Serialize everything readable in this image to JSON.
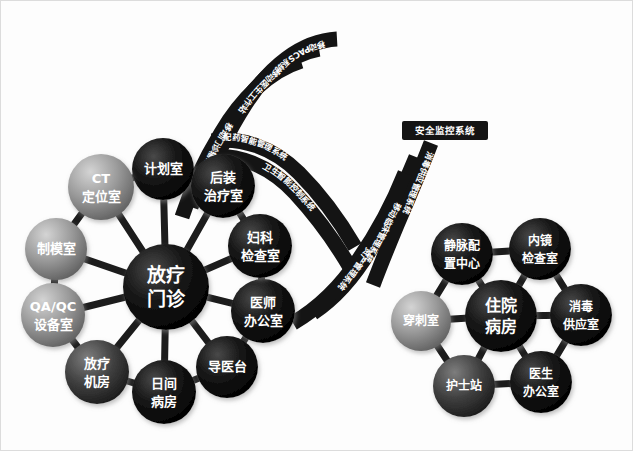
{
  "diagram": {
    "background_color": "#fdfdfd",
    "edge_color": "#1c1c1c",
    "band_color": "#141414",
    "text_color": "#ffffff"
  },
  "clusters": [
    {
      "id": "radiotherapy-outpatient",
      "center": {
        "label_line1": "放疗",
        "label_line2": "门诊",
        "cx": 165,
        "cy": 286,
        "r": 43,
        "color": "#0d0d0d",
        "font_size": 19
      },
      "nodes": [
        {
          "id": "plan-room",
          "label_line1": "计划室",
          "label_line2": "",
          "cx": 162,
          "cy": 168,
          "r": 31,
          "color": "#111111",
          "font_size": 13
        },
        {
          "id": "ct-locate",
          "label_line1": "CT",
          "label_line2": "定位室",
          "cx": 100,
          "cy": 186,
          "r": 33,
          "color": "#8c8c8c",
          "font_size": 13
        },
        {
          "id": "mold-room",
          "label_line1": "制模室",
          "label_line2": "",
          "cx": 55,
          "cy": 248,
          "r": 31,
          "color": "#777777",
          "font_size": 13
        },
        {
          "id": "qaqc-equipment",
          "label_line1": "QA/QC",
          "label_line2": "设备室",
          "cx": 52,
          "cy": 314,
          "r": 32,
          "color": "#8a8a8a",
          "font_size": 13
        },
        {
          "id": "rt-machine",
          "label_line1": "放疗",
          "label_line2": "机房",
          "cx": 96,
          "cy": 371,
          "r": 32,
          "color": "#4a4a4a",
          "font_size": 13
        },
        {
          "id": "day-ward",
          "label_line1": "日间",
          "label_line2": "病房",
          "cx": 163,
          "cy": 391,
          "r": 32,
          "color": "#2a2a2a",
          "font_size": 13
        },
        {
          "id": "guide-desk",
          "label_line1": "导医台",
          "label_line2": "",
          "cx": 226,
          "cy": 366,
          "r": 31,
          "color": "#161616",
          "font_size": 13
        },
        {
          "id": "doctor-office",
          "label_line1": "医师",
          "label_line2": "办公室",
          "cx": 262,
          "cy": 310,
          "r": 32,
          "color": "#101010",
          "font_size": 13
        },
        {
          "id": "gyn-exam",
          "label_line1": "妇科",
          "label_line2": "检查室",
          "cx": 259,
          "cy": 245,
          "r": 32,
          "color": "#0e0e0e",
          "font_size": 13
        },
        {
          "id": "brachytherapy",
          "label_line1": "后装",
          "label_line2": "治疗室",
          "cx": 222,
          "cy": 185,
          "r": 32,
          "color": "#0e0e0e",
          "font_size": 13
        }
      ]
    },
    {
      "id": "inpatient-ward",
      "center": {
        "label_line1": "住院",
        "label_line2": "病房",
        "cx": 500,
        "cy": 315,
        "r": 36,
        "color": "#0d0d0d",
        "font_size": 16
      },
      "nodes": [
        {
          "id": "iv-compound",
          "label_line1": "静脉配",
          "label_line2": "置中心",
          "cx": 461,
          "cy": 253,
          "r": 31,
          "color": "#0f0f0f",
          "font_size": 12
        },
        {
          "id": "endoscopy",
          "label_line1": "内镜",
          "label_line2": "检查室",
          "cx": 539,
          "cy": 248,
          "r": 31,
          "color": "#0f0f0f",
          "font_size": 12
        },
        {
          "id": "sterile-supply",
          "label_line1": "消毒",
          "label_line2": "供应室",
          "cx": 580,
          "cy": 314,
          "r": 31,
          "color": "#121212",
          "font_size": 12
        },
        {
          "id": "doctors-office",
          "label_line1": "医生",
          "label_line2": "办公室",
          "cx": 540,
          "cy": 381,
          "r": 31,
          "color": "#141414",
          "font_size": 12
        },
        {
          "id": "nurse-station",
          "label_line1": "护士站",
          "label_line2": "",
          "cx": 463,
          "cy": 385,
          "r": 31,
          "color": "#4d4d4d",
          "font_size": 12
        },
        {
          "id": "puncture-room",
          "label_line1": "穿刺室",
          "label_line2": "",
          "cx": 420,
          "cy": 320,
          "r": 30,
          "color": "#8f8f8f",
          "font_size": 12
        }
      ]
    }
  ],
  "bands": [
    {
      "id": "mobile-pacs",
      "label": "移动PACS系统",
      "path_index": 0
    },
    {
      "id": "mobile-doctor-station",
      "label": "移动医生工作站",
      "path_index": 1
    },
    {
      "id": "mobile-clinic-infusion",
      "label": "移动门诊输液系统",
      "path_index": 2
    },
    {
      "id": "pharmacy-smart-mgmt",
      "label": "配药智能管理系统",
      "path_index": 3
    },
    {
      "id": "hygiene-smart-control",
      "label": "卫生智能控制系统",
      "path_index": 4
    },
    {
      "id": "sterile-supply-mgmt",
      "label": "消毒供应管理系统",
      "path_index": 5
    },
    {
      "id": "mobile-clinical-mgmt",
      "label": "移动临床管理系统",
      "path_index": 6
    },
    {
      "id": "asset-mgmt",
      "label": "资产管理系统",
      "path_index": 7
    }
  ],
  "tags": [
    {
      "id": "security-monitor-tag",
      "label": "安全监控系统",
      "x": 403,
      "y": 122,
      "w": 82,
      "h": 17
    }
  ]
}
